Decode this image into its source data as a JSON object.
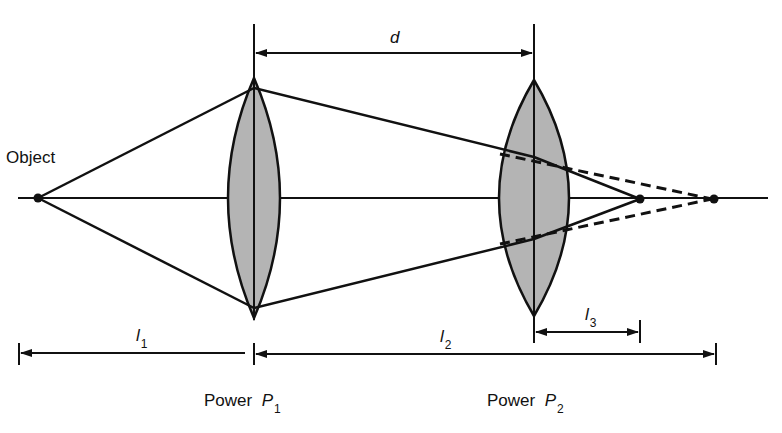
{
  "diagram": {
    "type": "thin-lens-system",
    "colors": {
      "line": "#111111",
      "lens_fill": "#b4b4b4",
      "background": "#ffffff"
    },
    "labels": {
      "object": "Object",
      "separation": "d",
      "l1": {
        "symbol": "l",
        "sub": "1"
      },
      "l2": {
        "symbol": "l",
        "sub": "2"
      },
      "l3": {
        "symbol": "l",
        "sub": "3"
      },
      "lens1": {
        "prefix": "Power",
        "symbol": "P",
        "sub": "1"
      },
      "lens2": {
        "prefix": "Power",
        "symbol": "P",
        "sub": "2"
      }
    },
    "geometry": {
      "optical_axis_y": 198,
      "object_x": 38,
      "lens1_x": 254,
      "lens2_x": 534,
      "image_x": 640,
      "virtual_image_x": 714
    }
  }
}
